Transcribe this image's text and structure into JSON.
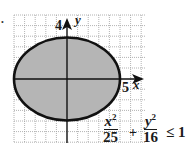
{
  "figure": {
    "grid": {
      "x_min": -5,
      "x_max": 7,
      "y_min": -6,
      "y_max": 6,
      "color": "#9a9a9a"
    },
    "ellipse": {
      "a": 5,
      "b": 4,
      "fill": "#b8b8b8",
      "stroke": "#111111"
    },
    "axes": {
      "x_label": "x",
      "y_label": "y",
      "x_tick_label": "5",
      "y_tick_label": "4"
    },
    "inequality": {
      "term1_num_var": "x",
      "term1_num_exp": "2",
      "term1_den": "25",
      "plus": "+",
      "term2_num_var": "y",
      "term2_num_exp": "2",
      "term2_den": "16",
      "relation": "≤ 1"
    },
    "bullet": "•"
  }
}
